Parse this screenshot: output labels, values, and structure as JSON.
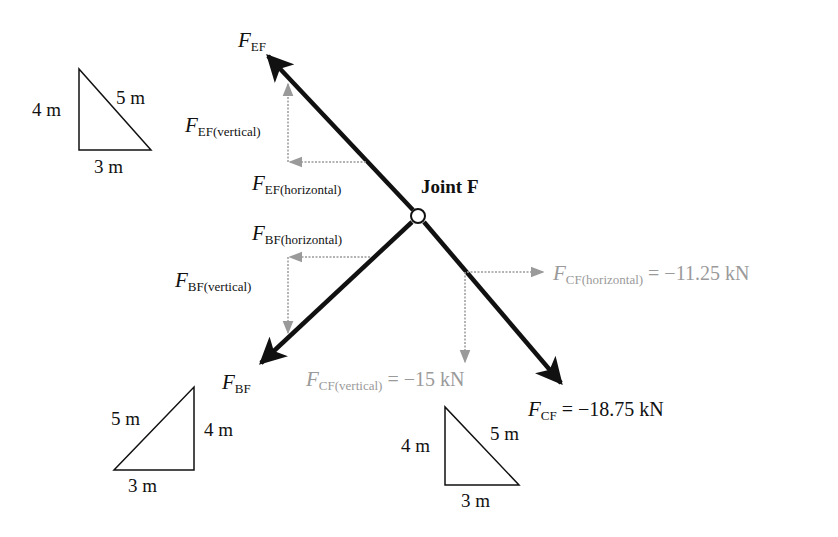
{
  "joint": {
    "label": "Joint F"
  },
  "colors": {
    "member": "#111111",
    "component": "#9a9a9a",
    "background": "#ffffff"
  },
  "forces": {
    "ef": {
      "symbol": "F",
      "sub": "EF"
    },
    "ef_vertical": {
      "symbol": "F",
      "sub": "EF(vertical)"
    },
    "ef_horizontal": {
      "symbol": "F",
      "sub": "EF(horizontal)"
    },
    "bf": {
      "symbol": "F",
      "sub": "BF"
    },
    "bf_vertical": {
      "symbol": "F",
      "sub": "BF(vertical)"
    },
    "bf_horizontal": {
      "symbol": "F",
      "sub": "BF(horizontal)"
    },
    "cf": {
      "symbol": "F",
      "sub": "CF",
      "value": " = −18.75 kN"
    },
    "cf_vertical": {
      "symbol": "F",
      "sub": "CF(vertical)",
      "value": " = −15 kN"
    },
    "cf_horizontal": {
      "symbol": "F",
      "sub": "CF(horizontal)",
      "value": " = −11.25 kN"
    }
  },
  "triangles": {
    "ef": {
      "vertical": "4 m",
      "hypotenuse": "5 m",
      "base": "3 m"
    },
    "bf": {
      "vertical": "4 m",
      "hypotenuse": "5 m",
      "base": "3 m"
    },
    "cf": {
      "vertical": "4 m",
      "hypotenuse": "5 m",
      "base": "3 m"
    }
  }
}
